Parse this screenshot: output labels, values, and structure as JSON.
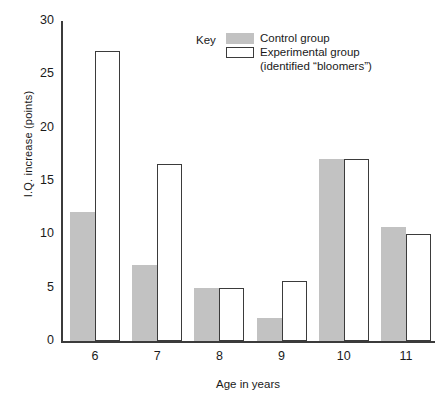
{
  "chart_data": {
    "type": "bar",
    "title": "",
    "xlabel": "Age in years",
    "ylabel": "I.Q. increase (points)",
    "categories": [
      "6",
      "7",
      "8",
      "9",
      "10",
      "11"
    ],
    "ylim": [
      0,
      30
    ],
    "yticks": [
      "0",
      "5",
      "10",
      "15",
      "20",
      "25",
      "30"
    ],
    "ytick_values": [
      0,
      5,
      10,
      15,
      20,
      25,
      30
    ],
    "grid": false,
    "legend_position": "top-right",
    "series": [
      {
        "name": "Control group",
        "color": "#c2c2c2",
        "values": [
          12.1,
          7.1,
          5.0,
          2.2,
          17.1,
          10.7
        ]
      },
      {
        "name": "Experimental group (identified \"bloomers\")",
        "color": "#ffffff",
        "values": [
          27.2,
          16.6,
          5.0,
          5.6,
          17.1,
          10.0
        ]
      }
    ]
  },
  "legend": {
    "key_label": "Key",
    "control_label": "Control group",
    "experimental_label_line1": "Experimental group",
    "experimental_label_line2": "(identified “bloomers”)"
  },
  "axes": {
    "y_title": "I.Q. increase (points)",
    "x_title": "Age in years"
  },
  "colors": {
    "control_fill": "#c2c2c2",
    "experimental_fill": "#ffffff",
    "axis": "#3b3b3b",
    "text": "#1a1a1a"
  }
}
